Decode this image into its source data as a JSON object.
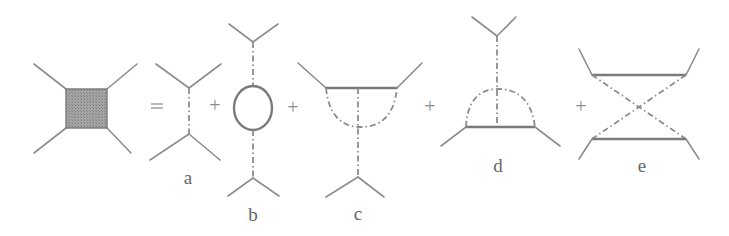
{
  "figure": {
    "type": "Feynman diagram expansion",
    "lhs": {
      "shape": "shaded-square-vertex",
      "fill": "#9a9a9a"
    },
    "operators": {
      "equals": "=",
      "plus": "+"
    },
    "terms": [
      {
        "id": "a",
        "label": "a",
        "description": "tree-level exchange (single dashed propagator)"
      },
      {
        "id": "b",
        "label": "b",
        "description": "self-energy bubble on exchanged line"
      },
      {
        "id": "c",
        "label": "c",
        "description": "vertex correction (upper)"
      },
      {
        "id": "d",
        "label": "d",
        "description": "vertex correction (lower)"
      },
      {
        "id": "e",
        "label": "e",
        "description": "crossed box exchange"
      }
    ],
    "colors": {
      "line": "#8d8d8d",
      "label": "#666666",
      "background": "#ffffff"
    }
  }
}
